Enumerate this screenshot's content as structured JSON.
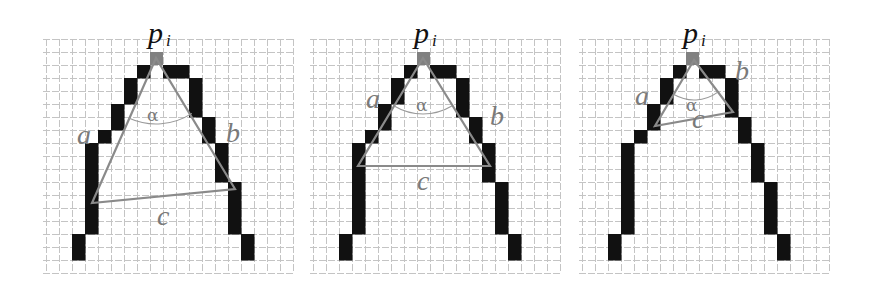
{
  "figure": {
    "colors": {
      "background": "#ffffff",
      "grid_line": "#c4c4c4",
      "pixel_fill": "#111111",
      "center_pixel": "#808080",
      "triangle_line": "#8a8a8a",
      "arc_line": "#9a9a9a",
      "side_label": "#7a7a7a",
      "point_label": "#111111"
    },
    "grid": {
      "cell_size": 13,
      "cols": 19,
      "rows": 18,
      "top": 39
    },
    "contour_pixels": [
      [
        7,
        2
      ],
      [
        9,
        2
      ],
      [
        10,
        2
      ],
      [
        6,
        3
      ],
      [
        6,
        4
      ],
      [
        11,
        3
      ],
      [
        11,
        4
      ],
      [
        11,
        5
      ],
      [
        5,
        5
      ],
      [
        5,
        6
      ],
      [
        12,
        6
      ],
      [
        12,
        7
      ],
      [
        4,
        7
      ],
      [
        3,
        8
      ],
      [
        3,
        9
      ],
      [
        3,
        10
      ],
      [
        3,
        11
      ],
      [
        3,
        12
      ],
      [
        3,
        13
      ],
      [
        3,
        14
      ],
      [
        13,
        8
      ],
      [
        13,
        9
      ],
      [
        13,
        10
      ],
      [
        14,
        11
      ],
      [
        14,
        12
      ],
      [
        14,
        13
      ],
      [
        14,
        14
      ],
      [
        2,
        15
      ],
      [
        2,
        16
      ],
      [
        15,
        15
      ],
      [
        15,
        16
      ]
    ],
    "center_pixel": [
      8,
      1
    ],
    "labels": {
      "point": "p",
      "point_subscript": "i",
      "side_a": "a",
      "side_b": "b",
      "side_c": "c",
      "angle": "α"
    },
    "panels": [
      {
        "name": "panel-1",
        "left": 46,
        "width": 248,
        "apex": [
          156,
          58
        ],
        "left_vertex": [
          92,
          203
        ],
        "right_vertex": [
          235,
          189
        ],
        "arc": {
          "cx": 156,
          "cy": 58,
          "r": 66,
          "start_deg": 114,
          "end_deg": 57
        },
        "label_positions": {
          "p": [
            148,
            43
          ],
          "i": [
            166,
            46
          ],
          "a": [
            77,
            144
          ],
          "b": [
            226,
            142
          ],
          "c": [
            157,
            225
          ],
          "alpha": [
            147,
            121
          ]
        }
      },
      {
        "name": "panel-2",
        "left": 313,
        "width": 248,
        "apex": [
          423,
          58
        ],
        "left_vertex": [
          358,
          166
        ],
        "right_vertex": [
          490,
          166
        ],
        "arc": {
          "cx": 423,
          "cy": 58,
          "r": 56,
          "start_deg": 121,
          "end_deg": 59
        },
        "label_positions": {
          "p": [
            414,
            43
          ],
          "i": [
            432,
            46
          ],
          "a": [
            366,
            108
          ],
          "b": [
            490,
            125
          ],
          "c": [
            417,
            190
          ],
          "alpha": [
            416,
            111
          ]
        }
      },
      {
        "name": "panel-3",
        "left": 582,
        "width": 248,
        "apex": [
          694,
          60
        ],
        "left_vertex": [
          655,
          126
        ],
        "right_vertex": [
          733,
          112
        ],
        "arc": {
          "cx": 694,
          "cy": 60,
          "r": 40,
          "start_deg": 120,
          "end_deg": 54
        },
        "label_positions": {
          "p": [
            683,
            43
          ],
          "i": [
            701,
            46
          ],
          "a": [
            635,
            105
          ],
          "b": [
            735,
            80
          ],
          "c": [
            692,
            128
          ],
          "alpha": [
            686,
            111
          ]
        }
      }
    ]
  }
}
